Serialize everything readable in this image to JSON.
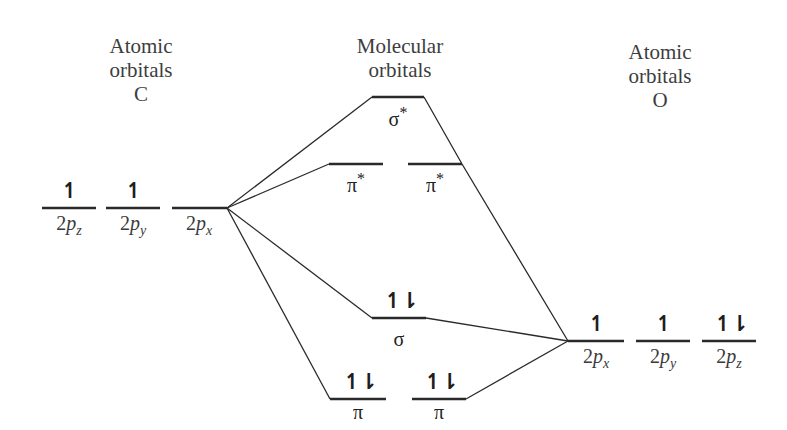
{
  "headings": {
    "left": {
      "line1": "Atomic",
      "line2": "orbitals",
      "line3": "C"
    },
    "center": {
      "line1": "Molecular",
      "line2": "orbitals"
    },
    "right": {
      "line1": "Atomic",
      "line2": "orbitals",
      "line3": "O"
    }
  },
  "carbon_orbitals": [
    {
      "prefix": "2",
      "letter": "p",
      "sub": "z",
      "electrons": "↿"
    },
    {
      "prefix": "2",
      "letter": "p",
      "sub": "y",
      "electrons": "↿"
    },
    {
      "prefix": "2",
      "letter": "p",
      "sub": "x",
      "electrons": ""
    }
  ],
  "oxygen_orbitals": [
    {
      "prefix": "2",
      "letter": "p",
      "sub": "x",
      "electrons": "↿"
    },
    {
      "prefix": "2",
      "letter": "p",
      "sub": "y",
      "electrons": "↿"
    },
    {
      "prefix": "2",
      "letter": "p",
      "sub": "z",
      "electrons": "↿⇂"
    }
  ],
  "molecular_orbitals": {
    "sigma_star": {
      "symbol": "σ",
      "star": "*",
      "electrons": ""
    },
    "pi_star_1": {
      "symbol": "π",
      "star": "*",
      "electrons": ""
    },
    "pi_star_2": {
      "symbol": "π",
      "star": "*",
      "electrons": ""
    },
    "sigma": {
      "symbol": "σ",
      "star": "",
      "electrons": "↿⇂"
    },
    "pi_1": {
      "symbol": "π",
      "star": "",
      "electrons": "↿⇂"
    },
    "pi_2": {
      "symbol": "π",
      "star": "",
      "electrons": "↿⇂"
    }
  },
  "colors": {
    "line": "#2a2a2a",
    "text": "#3a3a3a"
  }
}
